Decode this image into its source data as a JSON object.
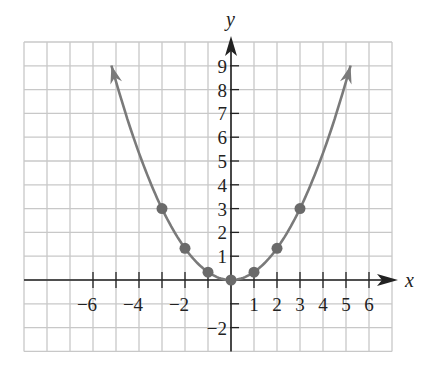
{
  "chart_data": {
    "type": "line",
    "title": "",
    "xlabel": "x",
    "ylabel": "y",
    "xlim": [
      -9,
      7
    ],
    "ylim": [
      -3,
      10
    ],
    "grid": true,
    "function": "y = x^2 / 3",
    "x_tick_labels": [
      {
        "value": -6,
        "label": "−6"
      },
      {
        "value": -4,
        "label": "−4"
      },
      {
        "value": -2,
        "label": "−2"
      },
      {
        "value": 1,
        "label": "1"
      },
      {
        "value": 2,
        "label": "2"
      },
      {
        "value": 3,
        "label": "3"
      },
      {
        "value": 4,
        "label": "4"
      },
      {
        "value": 5,
        "label": "5"
      },
      {
        "value": 6,
        "label": "6"
      }
    ],
    "x_ticks": [
      -6,
      -5,
      -4,
      -3,
      -2,
      -1,
      1,
      2,
      3,
      4,
      5,
      6
    ],
    "y_tick_labels": [
      {
        "value": 9,
        "label": "9"
      },
      {
        "value": 8,
        "label": "8"
      },
      {
        "value": 7,
        "label": "7"
      },
      {
        "value": 6,
        "label": "6"
      },
      {
        "value": 5,
        "label": "5"
      },
      {
        "value": 4,
        "label": "4"
      },
      {
        "value": 3,
        "label": "3"
      },
      {
        "value": 2,
        "label": "2"
      },
      {
        "value": 1,
        "label": "1"
      },
      {
        "value": -2,
        "label": "−2"
      }
    ],
    "y_ticks": [
      9,
      8,
      7,
      6,
      5,
      4,
      3,
      2,
      1,
      -1,
      -2
    ],
    "series": [
      {
        "name": "parabola",
        "curve_x_range": [
          -5.2,
          5.2
        ],
        "arrows_at_ends": true,
        "points": [
          {
            "x": -3,
            "y": 3
          },
          {
            "x": -2,
            "y": 1.33
          },
          {
            "x": -1,
            "y": 0.33
          },
          {
            "x": 0,
            "y": 0
          },
          {
            "x": 1,
            "y": 0.33
          },
          {
            "x": 2,
            "y": 1.33
          },
          {
            "x": 3,
            "y": 3
          }
        ]
      }
    ]
  },
  "colors": {
    "grid": "#c8c8c8",
    "axis": "#222222",
    "curve": "#7a7a7a",
    "points": "#6a6a6a"
  }
}
